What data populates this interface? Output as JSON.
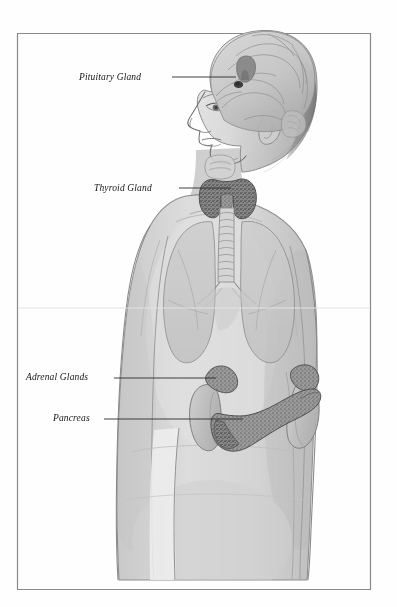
{
  "figure": {
    "style": "pencil/graphite medical illustration, greyscale",
    "frame": {
      "present": true,
      "stroke_color": "#8d8d8d",
      "left": 17,
      "top": 33,
      "right": 371,
      "bottom": 590
    },
    "background_color": "#ffffff",
    "body_fill": "#d7d7d7",
    "organ_fill": "#9a9a9a",
    "gland_fill": "#7b7b7b",
    "leader_color": "#2a2a2e"
  },
  "labels": [
    {
      "id": "pituitary",
      "text": "Pituitary Gland",
      "text_x": 79,
      "text_y": 72,
      "leader": {
        "x1": 172,
        "y1": 77,
        "x2": 236,
        "y2": 77
      },
      "target": "pituitary-gland"
    },
    {
      "id": "thyroid",
      "text": "Thyroid Gland",
      "text_x": 94,
      "text_y": 183,
      "leader": {
        "x1": 179,
        "y1": 188,
        "x2": 231,
        "y2": 188
      },
      "target": "thyroid-gland"
    },
    {
      "id": "adrenal",
      "text": "Adrenal Glands",
      "text_x": 26,
      "text_y": 372,
      "leader": {
        "x1": 114,
        "y1": 378,
        "x2": 216,
        "y2": 378
      },
      "target": "adrenal-glands"
    },
    {
      "id": "pancreas",
      "text": "Pancreas",
      "text_x": 53,
      "text_y": 413,
      "leader": {
        "x1": 104,
        "y1": 419,
        "x2": 243,
        "y2": 419
      },
      "target": "pancreas"
    }
  ],
  "structures": [
    {
      "name": "brain",
      "visible": true,
      "shaded": true
    },
    {
      "name": "pituitary-gland",
      "visible": true,
      "shaded": true
    },
    {
      "name": "head-profile",
      "visible": true,
      "shaded": true
    },
    {
      "name": "thyroid-gland",
      "visible": true,
      "shaded": true
    },
    {
      "name": "trachea",
      "visible": true,
      "shaded": true
    },
    {
      "name": "lungs",
      "visible": true,
      "shaded": true
    },
    {
      "name": "adrenal-glands",
      "visible": true,
      "shaded": true
    },
    {
      "name": "kidneys",
      "visible": true,
      "shaded": true
    },
    {
      "name": "pancreas",
      "visible": true,
      "shaded": true
    },
    {
      "name": "torso",
      "visible": true,
      "shaded": true
    },
    {
      "name": "arms",
      "visible": true,
      "shaded": true
    }
  ]
}
